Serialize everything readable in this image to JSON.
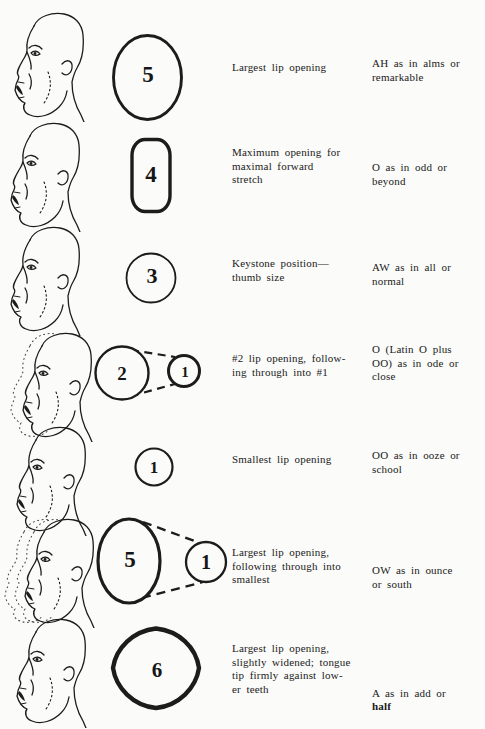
{
  "page": {
    "ink_color": "#1c1c1c",
    "paper_color": "#fbfbf9"
  },
  "rows": [
    {
      "face": "face-sketch-open-mouth",
      "shape": {
        "kind": "ellipse",
        "number": "5"
      },
      "desc": "Largest lip opening",
      "sound": "AH as in alms or\nremarkable"
    },
    {
      "face": "face-sketch-open-mouth",
      "shape": {
        "kind": "rounded-rect",
        "number": "4"
      },
      "desc": "Maximum opening for\nmaximal forward\nstretch",
      "sound": "O as in odd or\nbeyond"
    },
    {
      "face": "face-sketch-open-mouth",
      "shape": {
        "kind": "circle",
        "number": "3"
      },
      "desc": "Keystone position—\nthumb size",
      "sound": "AW as in all or\nnormal"
    },
    {
      "face": "face-sketch-with-ghost",
      "shape": {
        "kind": "two-circles-dashed",
        "number": "2",
        "number2": "1"
      },
      "desc": "#2 lip opening, follow-\ning through into #1",
      "sound": "O (Latin O plus\nOO) as in ode or\nclose"
    },
    {
      "face": "face-sketch-open-mouth",
      "shape": {
        "kind": "circle",
        "number": "1"
      },
      "desc": "Smallest lip opening",
      "sound": "OO as in ooze or\nschool"
    },
    {
      "face": "face-sketch-with-two-ghosts",
      "shape": {
        "kind": "two-circles-dashed",
        "number": "5",
        "number2": "1"
      },
      "desc": "Largest lip opening,\nfollowing through into\nsmallest",
      "sound": "OW as in ounce\nor south"
    },
    {
      "face": "face-sketch-open-mouth",
      "shape": {
        "kind": "rounded-diamond",
        "number": "6"
      },
      "desc": "Largest lip opening,\nslightly widened; tongue\ntip firmly against low-\ner teeth",
      "sound": "A as in add or\n",
      "sound_bold": "half"
    }
  ]
}
